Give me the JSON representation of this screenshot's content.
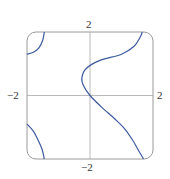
{
  "chart_data": {
    "type": "line",
    "title": "",
    "xlabel": "",
    "ylabel": "",
    "xlim": [
      -2,
      2
    ],
    "ylim": [
      -2,
      2
    ],
    "grid": false,
    "legend": null,
    "tick_labels": {
      "top": "2",
      "bottom": "−2",
      "left": "−2",
      "right": "2"
    },
    "series": [
      {
        "name": "main-curve",
        "points": [
          [
            1.7,
            -2
          ],
          [
            1.55,
            -1.75
          ],
          [
            1.35,
            -1.4
          ],
          [
            1.1,
            -1.05
          ],
          [
            0.8,
            -0.75
          ],
          [
            0.35,
            -0.35
          ],
          [
            0,
            0
          ],
          [
            -0.2,
            0.3
          ],
          [
            -0.26,
            0.55
          ],
          [
            -0.12,
            0.85
          ],
          [
            0.3,
            1.1
          ],
          [
            1.0,
            1.3
          ],
          [
            1.4,
            1.55
          ],
          [
            1.6,
            1.85
          ],
          [
            1.66,
            2
          ]
        ]
      },
      {
        "name": "top-left-curve",
        "points": [
          [
            -1.45,
            2
          ],
          [
            -1.5,
            1.75
          ],
          [
            -1.62,
            1.5
          ],
          [
            -1.8,
            1.36
          ],
          [
            -2,
            1.3
          ]
        ]
      },
      {
        "name": "bottom-left-curve",
        "points": [
          [
            -2,
            -0.9
          ],
          [
            -1.8,
            -1.12
          ],
          [
            -1.65,
            -1.4
          ],
          [
            -1.52,
            -1.7
          ],
          [
            -1.45,
            -2
          ]
        ]
      }
    ],
    "colors": {
      "curve": "#3d5a9e",
      "axes": "#a8a8a8",
      "frame": "#9a9a9a"
    }
  }
}
